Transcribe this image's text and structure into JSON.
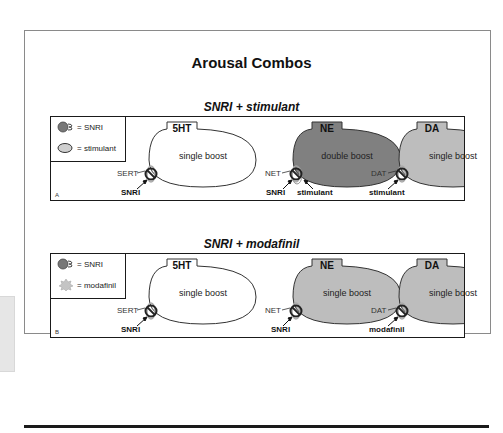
{
  "title": "Arousal Combos",
  "colors": {
    "white_ellipse": "#ffffff",
    "ne_double": "#808080",
    "single_gray": "#bdbdbd",
    "outline": "#333333"
  },
  "legend_icons": {
    "snri": "snri-transporter-blocker-icon",
    "stimulant": "stimulant-oval-icon",
    "modafinil": "modafinil-star-icon"
  },
  "panels": [
    {
      "letter": "A",
      "subtitle": "SNRI + stimulant",
      "legend": [
        {
          "label": "= SNRI"
        },
        {
          "label": "= stimulant"
        }
      ],
      "neurons": [
        {
          "nt": "5HT",
          "boost": "single boost",
          "transporter": "SERT",
          "drugs": [
            "SNRI"
          ]
        },
        {
          "nt": "NE",
          "boost": "double boost",
          "transporter": "NET",
          "drugs": [
            "SNRI",
            "stimulant"
          ]
        },
        {
          "nt": "DA",
          "boost": "single boost",
          "transporter": "DAT",
          "drugs": [
            "stimulant"
          ]
        }
      ]
    },
    {
      "letter": "B",
      "subtitle": "SNRI + modafinil",
      "legend": [
        {
          "label": "= SNRI"
        },
        {
          "label": "= modafinil"
        }
      ],
      "neurons": [
        {
          "nt": "5HT",
          "boost": "single boost",
          "transporter": "SERT",
          "drugs": [
            "SNRI"
          ]
        },
        {
          "nt": "NE",
          "boost": "single boost",
          "transporter": "NET",
          "drugs": [
            "SNRI"
          ]
        },
        {
          "nt": "DA",
          "boost": "single boost",
          "transporter": "DAT",
          "drugs": [
            "modafinil"
          ]
        }
      ]
    }
  ]
}
